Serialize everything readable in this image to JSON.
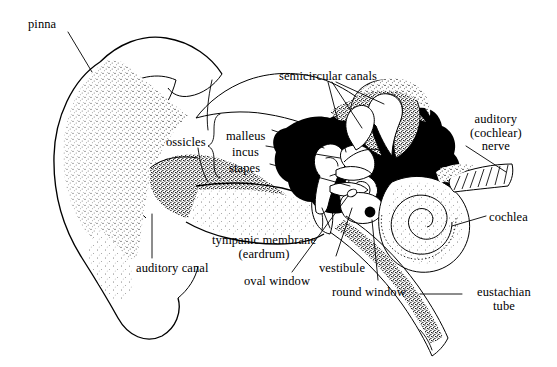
{
  "figure": {
    "background_color": "#ffffff",
    "ink_color": "#000000",
    "style": "pen-and-ink stipple line drawing",
    "width": 557,
    "height": 367
  },
  "labels": [
    {
      "id": "pinna",
      "text": "pinna",
      "lines": [
        "pinna"
      ],
      "x": 28,
      "y": 18,
      "align": "left"
    },
    {
      "id": "ossicles",
      "text": "ossicles",
      "lines": [
        "ossicles"
      ],
      "x": 166,
      "y": 136,
      "align": "left"
    },
    {
      "id": "malleus",
      "text": "malleus",
      "lines": [
        "malleus"
      ],
      "x": 226,
      "y": 130,
      "align": "left"
    },
    {
      "id": "incus",
      "text": "incus",
      "lines": [
        "incus"
      ],
      "x": 232,
      "y": 146,
      "align": "left"
    },
    {
      "id": "stapes",
      "text": "stapes",
      "lines": [
        "stapes"
      ],
      "x": 229,
      "y": 162,
      "align": "left"
    },
    {
      "id": "semicircular-canals",
      "text": "semicircular canals",
      "lines": [
        "semicircular canals"
      ],
      "x": 279,
      "y": 70,
      "align": "left"
    },
    {
      "id": "auditory-nerve",
      "text": "auditory (cochlear) nerve",
      "lines": [
        "auditory",
        "(cochlear)",
        "nerve"
      ],
      "x": 470,
      "y": 113,
      "align": "left"
    },
    {
      "id": "cochlea",
      "text": "cochlea",
      "lines": [
        "cochlea"
      ],
      "x": 489,
      "y": 211,
      "align": "left"
    },
    {
      "id": "tympanic-membrane",
      "text": "tympanic membrane (eardrum)",
      "lines": [
        "tympanic membrane",
        "(eardrum)"
      ],
      "x": 264,
      "y": 234,
      "align": "center"
    },
    {
      "id": "auditory-canal",
      "text": "auditory canal",
      "lines": [
        "auditory canal"
      ],
      "x": 136,
      "y": 262,
      "align": "left"
    },
    {
      "id": "oval-window",
      "text": "oval window",
      "lines": [
        "oval window"
      ],
      "x": 244,
      "y": 275,
      "align": "left"
    },
    {
      "id": "vestibule",
      "text": "vestibule",
      "lines": [
        "vestibule"
      ],
      "x": 319,
      "y": 262,
      "align": "left"
    },
    {
      "id": "round-window",
      "text": "round window",
      "lines": [
        "round window"
      ],
      "x": 332,
      "y": 286,
      "align": "left"
    },
    {
      "id": "eustachian-tube",
      "text": "eustachian tube",
      "lines": [
        "eustachian",
        "tube"
      ],
      "x": 466,
      "y": 286,
      "align": "left"
    }
  ],
  "structures": [
    {
      "id": "pinna",
      "name": "pinna",
      "region": "outer ear"
    },
    {
      "id": "auditory-canal",
      "name": "auditory canal",
      "region": "outer ear"
    },
    {
      "id": "tympanic-membrane",
      "name": "tympanic membrane (eardrum)",
      "region": "middle ear"
    },
    {
      "id": "malleus",
      "name": "malleus",
      "region": "middle ear"
    },
    {
      "id": "incus",
      "name": "incus",
      "region": "middle ear"
    },
    {
      "id": "stapes",
      "name": "stapes",
      "region": "middle ear"
    },
    {
      "id": "oval-window",
      "name": "oval window",
      "region": "middle ear"
    },
    {
      "id": "round-window",
      "name": "round window",
      "region": "middle ear"
    },
    {
      "id": "eustachian-tube",
      "name": "eustachian tube",
      "region": "middle ear"
    },
    {
      "id": "semicircular-canals",
      "name": "semicircular canals",
      "region": "inner ear"
    },
    {
      "id": "vestibule",
      "name": "vestibule",
      "region": "inner ear"
    },
    {
      "id": "cochlea",
      "name": "cochlea",
      "region": "inner ear"
    },
    {
      "id": "auditory-nerve",
      "name": "auditory (cochlear) nerve",
      "region": "inner ear"
    }
  ]
}
